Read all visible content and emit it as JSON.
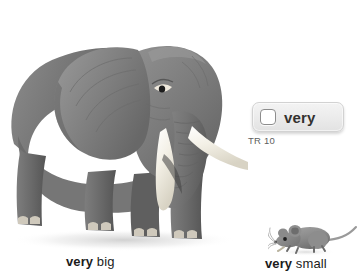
{
  "page": {
    "background_color": "#ffffff",
    "width": 361,
    "height": 279
  },
  "word_button": {
    "label": "very",
    "checkbox_state": "unchecked",
    "checkbox_icon": "empty-checkbox-icon",
    "background_color": "#ececec",
    "border_color": "#d2d2d2",
    "text_color": "#33312f"
  },
  "track_code": {
    "text": "TR 10",
    "color": "#5e5e5e"
  },
  "captions": {
    "big": {
      "emphasis": "very",
      "rest": " big"
    },
    "small": {
      "emphasis": "very",
      "rest": " small"
    }
  },
  "illustrations": {
    "elephant": {
      "icon_name": "elephant-illustration",
      "alt": "Large gray elephant facing forward with white tusks",
      "body_color": "#6e6e6e",
      "tusk_color": "#f2efe6"
    },
    "mouse": {
      "icon_name": "mouse-illustration",
      "alt": "Small gray mouse with long tail",
      "body_color": "#8a8a8a",
      "tail_color": "#9a9a9a"
    }
  }
}
